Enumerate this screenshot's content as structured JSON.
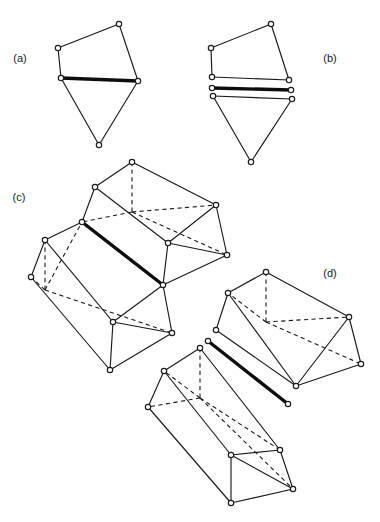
{
  "figure": {
    "width": 380,
    "height": 522,
    "background_color": "#ffffff",
    "line_color": "#1a1a1a",
    "highlight_color": "#0d0d0d",
    "vertex_fill": "#ffffff",
    "panels": [
      {
        "id": "a",
        "label": "(a)",
        "label_x": 20,
        "label_y": 62,
        "description": "Two-dimensional complex: a quadrilateral and a triangle joined along a common thick edge"
      },
      {
        "id": "b",
        "label": "(b)",
        "label_x": 330,
        "label_y": 62,
        "description": "Exploded two-dimensional complex: quadrilateral, isolated thick edge and triangle separated"
      },
      {
        "id": "c",
        "label": "(c)",
        "label_x": 19,
        "label_y": 201,
        "description": "Three-dimensional complex: two triangular prisms joined along a common thick edge"
      },
      {
        "id": "d",
        "label": "(d)",
        "label_x": 330,
        "label_y": 277,
        "description": "Exploded three-dimensional complex: two prisms separated with the thick edge isolated between them"
      }
    ],
    "geometry": {
      "panel_a": {
        "vertices": [
          {
            "name": "quad-top-right",
            "x": 119,
            "y": 24
          },
          {
            "name": "quad-left",
            "x": 58,
            "y": 48
          },
          {
            "name": "shared-left",
            "x": 61,
            "y": 78
          },
          {
            "name": "shared-right",
            "x": 138,
            "y": 81
          },
          {
            "name": "triangle-apex",
            "x": 99,
            "y": 145
          }
        ],
        "solid_edges": [
          [
            58,
            48,
            119,
            24
          ],
          [
            119,
            24,
            138,
            81
          ],
          [
            58,
            48,
            61,
            78
          ],
          [
            61,
            78,
            99,
            145
          ],
          [
            99,
            145,
            138,
            81
          ]
        ],
        "thick_edges": [
          [
            61,
            78,
            138,
            81
          ]
        ],
        "dashed_edges": []
      },
      "panel_b": {
        "vertices": [
          {
            "name": "quad-top-right",
            "x": 271,
            "y": 24
          },
          {
            "name": "quad-left",
            "x": 211,
            "y": 48
          },
          {
            "name": "quad-bottom-left",
            "x": 212,
            "y": 77
          },
          {
            "name": "quad-bottom-right",
            "x": 289,
            "y": 80
          },
          {
            "name": "edge-left",
            "x": 212,
            "y": 88
          },
          {
            "name": "edge-right",
            "x": 291,
            "y": 90
          },
          {
            "name": "tri-left",
            "x": 213,
            "y": 96
          },
          {
            "name": "tri-right",
            "x": 292,
            "y": 99
          },
          {
            "name": "triangle-apex",
            "x": 251,
            "y": 162
          }
        ],
        "solid_edges": [
          [
            211,
            48,
            271,
            24
          ],
          [
            271,
            24,
            289,
            80
          ],
          [
            211,
            48,
            212,
            77
          ],
          [
            212,
            77,
            289,
            80
          ],
          [
            213,
            96,
            292,
            99
          ],
          [
            213,
            96,
            251,
            162
          ],
          [
            251,
            162,
            292,
            99
          ]
        ],
        "thick_edges": [
          [
            212,
            88,
            291,
            90
          ]
        ],
        "dashed_edges": []
      },
      "panel_c": {
        "upper_prism": {
          "ridge_front": {
            "x": 82,
            "y": 222
          },
          "ridge_back": {
            "x": 132,
            "y": 162
          },
          "front_left": {
            "x": 95,
            "y": 187
          },
          "front_right": {
            "x": 168,
            "y": 243
          },
          "ridge_far": {
            "x": 216,
            "y": 205
          },
          "far_right": {
            "x": 227,
            "y": 255
          },
          "base_thick_end": {
            "x": 163,
            "y": 285
          }
        },
        "lower_prism": {
          "ridge_front": {
            "x": 45,
            "y": 240
          },
          "far_left": {
            "x": 31,
            "y": 277
          },
          "base_front": {
            "x": 113,
            "y": 322
          },
          "base_bottom": {
            "x": 110,
            "y": 370
          },
          "base_right": {
            "x": 172,
            "y": 333
          }
        },
        "thick_edges": [
          [
            82,
            222,
            163,
            285
          ]
        ]
      },
      "panel_d": {
        "upper_prism": {
          "ridge_back": {
            "x": 266,
            "y": 272
          },
          "front_left": {
            "x": 228,
            "y": 293
          },
          "ridge_right": {
            "x": 349,
            "y": 317
          },
          "far_right": {
            "x": 361,
            "y": 364
          },
          "front_bottom": {
            "x": 296,
            "y": 386
          }
        },
        "lower_prism": {
          "ridge_back": {
            "x": 200,
            "y": 348
          },
          "front_left": {
            "x": 164,
            "y": 371
          },
          "far_left": {
            "x": 148,
            "y": 407
          },
          "ridge_right": {
            "x": 280,
            "y": 450
          },
          "base_bottom": {
            "x": 231,
            "y": 503
          }
        },
        "thick_edges": [
          [
            208,
            341,
            288,
            404
          ]
        ]
      }
    }
  }
}
